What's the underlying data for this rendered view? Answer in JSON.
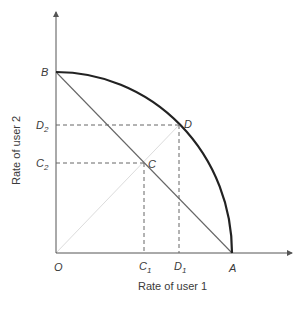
{
  "diagram": {
    "title": "",
    "xlabel": "Rate of user 1",
    "ylabel": "Rate of user 2",
    "points": {
      "origin": {
        "label": "O"
      },
      "A": {
        "label": "A"
      },
      "B": {
        "label": "B"
      },
      "C": {
        "label": "C"
      },
      "D": {
        "label": "D"
      }
    },
    "ticks": {
      "C1": {
        "base": "C",
        "sub": "1"
      },
      "D1": {
        "base": "D",
        "sub": "1"
      },
      "C2": {
        "base": "C",
        "sub": "2"
      },
      "D2": {
        "base": "D",
        "sub": "2"
      }
    },
    "colors": {
      "axis": "#555555",
      "curve": "#222222",
      "line": "#666666",
      "dashed": "#666666",
      "diagonal": "#dddddd",
      "text": "#3a3a3a"
    }
  }
}
